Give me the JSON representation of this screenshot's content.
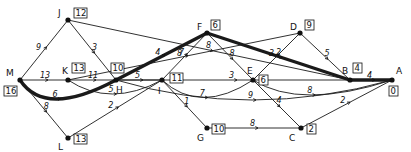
{
  "diagram": {
    "type": "network-shortest-path",
    "nodes": [
      {
        "id": "M",
        "label": "M",
        "value": "16",
        "x": 20,
        "y": 80
      },
      {
        "id": "J",
        "label": "J",
        "value": "12",
        "x": 68,
        "y": 20
      },
      {
        "id": "K",
        "label": "K",
        "value": "13",
        "x": 68,
        "y": 80
      },
      {
        "id": "L",
        "label": "L",
        "value": "13",
        "x": 68,
        "y": 138
      },
      {
        "id": "H",
        "label": "H",
        "value": "10",
        "x": 116,
        "y": 80
      },
      {
        "id": "I",
        "label": "I",
        "value": "11",
        "x": 162,
        "y": 80
      },
      {
        "id": "F",
        "label": "F",
        "value": "6",
        "x": 207,
        "y": 33
      },
      {
        "id": "G",
        "label": "G",
        "value": "10",
        "x": 207,
        "y": 128
      },
      {
        "id": "E",
        "label": "E",
        "value": "6",
        "x": 253,
        "y": 80
      },
      {
        "id": "D",
        "label": "D",
        "value": "9",
        "x": 300,
        "y": 33
      },
      {
        "id": "C",
        "label": "C",
        "value": "2",
        "x": 301,
        "y": 128
      },
      {
        "id": "B",
        "label": "B",
        "value": "4",
        "x": 350,
        "y": 80
      },
      {
        "id": "A",
        "label": "A",
        "value": "0",
        "x": 392,
        "y": 80
      }
    ],
    "edges": [
      {
        "from": "M",
        "to": "J",
        "weight": "9"
      },
      {
        "from": "M",
        "to": "K",
        "weight": "13"
      },
      {
        "from": "M",
        "to": "H",
        "weight": "6",
        "critical": true
      },
      {
        "from": "M",
        "to": "L",
        "weight": "8"
      },
      {
        "from": "J",
        "to": "H",
        "weight": "3"
      },
      {
        "from": "J",
        "to": "B",
        "weight": "8"
      },
      {
        "from": "K",
        "to": "H",
        "weight": "11"
      },
      {
        "from": "K",
        "to": "D",
        "weight": "7"
      },
      {
        "from": "K",
        "to": "I",
        "weight": "5"
      },
      {
        "from": "L",
        "to": "I",
        "weight": "2"
      },
      {
        "from": "H",
        "to": "F",
        "weight": "4",
        "critical": true
      },
      {
        "from": "H",
        "to": "I",
        "weight": "5"
      },
      {
        "from": "H",
        "to": "B",
        "weight": "3"
      },
      {
        "from": "H",
        "to": "A",
        "weight": "9"
      },
      {
        "from": "I",
        "to": "F",
        "weight": "8"
      },
      {
        "from": "I",
        "to": "G",
        "weight": "1"
      },
      {
        "from": "I",
        "to": "E",
        "weight": "7"
      },
      {
        "from": "F",
        "to": "B",
        "weight": "2",
        "critical": true
      },
      {
        "from": "F",
        "to": "E",
        "weight": "8"
      },
      {
        "from": "E",
        "to": "D",
        "weight": "3"
      },
      {
        "from": "E",
        "to": "C",
        "weight": "4"
      },
      {
        "from": "E",
        "to": "A",
        "weight": "8"
      },
      {
        "from": "G",
        "to": "C",
        "weight": "8"
      },
      {
        "from": "D",
        "to": "B",
        "weight": "5"
      },
      {
        "from": "C",
        "to": "A",
        "weight": "2"
      },
      {
        "from": "B",
        "to": "A",
        "weight": "4",
        "critical": true
      }
    ],
    "critical_path": [
      "M",
      "H",
      "F",
      "B",
      "A"
    ]
  }
}
